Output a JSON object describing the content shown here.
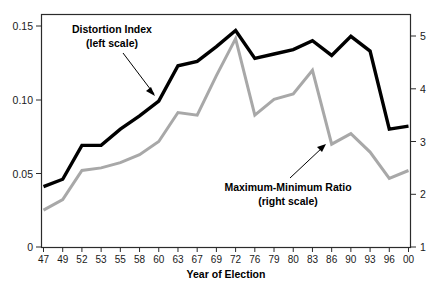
{
  "chart_data": {
    "type": "line",
    "title": "",
    "xlabel": "Year of Election",
    "ylabel": "",
    "grid": false,
    "legend_position": "inline-annotations",
    "categories": [
      "47",
      "49",
      "52",
      "53",
      "55",
      "58",
      "60",
      "63",
      "67",
      "69",
      "72",
      "76",
      "79",
      "80",
      "83",
      "86",
      "90",
      "93",
      "96",
      "00"
    ],
    "axes": {
      "left": {
        "label": "",
        "ticks": [
          "0",
          "0.05",
          "0.10",
          "0.15"
        ],
        "tick_values": [
          0,
          0.05,
          0.1,
          0.15
        ],
        "ylim": [
          0,
          0.15
        ]
      },
      "right": {
        "label": "",
        "ticks": [
          "1",
          "2",
          "3",
          "4",
          "5"
        ],
        "tick_values": [
          1,
          2,
          3,
          4,
          5
        ],
        "ylim": [
          1,
          5
        ]
      }
    },
    "series": [
      {
        "name": "Distortion Index",
        "scale": "left",
        "color": "#000000",
        "values": [
          0.041,
          0.046,
          0.069,
          0.069,
          0.08,
          0.089,
          0.099,
          0.123,
          0.126,
          0.136,
          0.147,
          0.128,
          0.131,
          0.134,
          0.14,
          0.13,
          0.143,
          0.133,
          0.08,
          0.082
        ]
      },
      {
        "name": "Maximum-Minimum Ratio",
        "scale": "right",
        "color": "#a8a8a8",
        "values": [
          1.7,
          1.9,
          2.45,
          2.5,
          2.6,
          2.75,
          3.0,
          3.55,
          3.5,
          4.25,
          4.95,
          3.5,
          3.8,
          3.9,
          4.35,
          2.95,
          3.15,
          2.8,
          2.3,
          2.45
        ]
      }
    ],
    "annotations": [
      {
        "id": "distortion-index",
        "line1": "Distortion Index",
        "line2": "(left scale)",
        "points_to_series": "Distortion Index"
      },
      {
        "id": "maximum-minimum-ratio",
        "line1": "Maximum-Minimum Ratio",
        "line2": "(right scale)",
        "points_to_series": "Maximum-Minimum Ratio"
      }
    ]
  }
}
